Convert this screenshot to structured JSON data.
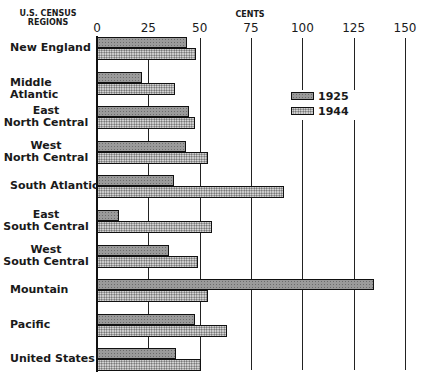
{
  "chart_data": {
    "type": "bar",
    "orientation": "horizontal",
    "title": "",
    "xlabel": "CENTS",
    "ylabel": "U.S. CENSUS REGIONS",
    "xlim": [
      0,
      150
    ],
    "xticks": [
      "0",
      "25",
      "50",
      "75",
      "100",
      "125",
      "150"
    ],
    "grid": true,
    "legend_position": "upper right (inside)",
    "categories": [
      "New England",
      "Middle Atlantic",
      "East North Central",
      "West North Central",
      "South Atlantic",
      "East South Central",
      "West South Central",
      "Mountain",
      "Pacific",
      "United States"
    ],
    "category_lines": [
      [
        "New England"
      ],
      [
        "Middle Atlantic"
      ],
      [
        "East",
        "North Central"
      ],
      [
        "West",
        "North Central"
      ],
      [
        "South Atlantic"
      ],
      [
        "East",
        "South Central"
      ],
      [
        "West",
        "South Central"
      ],
      [
        "Mountain"
      ],
      [
        "Pacific"
      ],
      [
        "United States"
      ]
    ],
    "series": [
      {
        "name": "1925",
        "values": [
          44,
          22,
          45,
          43.5,
          37.5,
          10.5,
          35,
          135,
          47.5,
          38.5
        ]
      },
      {
        "name": "1944",
        "values": [
          48,
          38,
          47.5,
          54,
          91,
          56,
          49,
          54,
          63.5,
          50.5
        ]
      }
    ]
  },
  "header": {
    "regions_line1": "U.S. CENSUS",
    "regions_line2": "REGIONS",
    "unit": "CENTS"
  },
  "legend": [
    {
      "label": "1925"
    },
    {
      "label": "1944"
    }
  ]
}
